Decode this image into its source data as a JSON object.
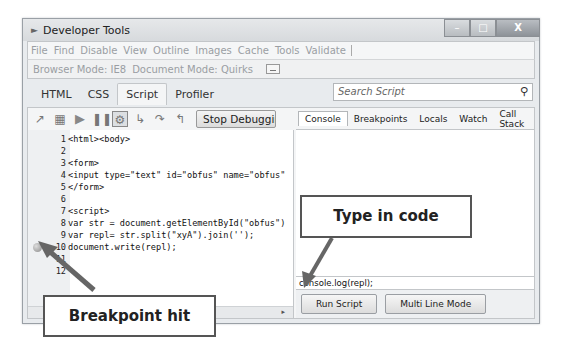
{
  "window": {
    "title": "Developer Tools",
    "controls": {
      "minimize": "–",
      "maximize": "□",
      "close": "X"
    }
  },
  "menubar": {
    "items": [
      "File",
      "Find",
      "Disable",
      "View",
      "Outline",
      "Images",
      "Cache",
      "Tools",
      "Validate"
    ]
  },
  "modebar": {
    "browser_mode": "Browser Mode: IE8",
    "document_mode": "Document Mode: Quirks"
  },
  "tabs": {
    "items": [
      "HTML",
      "CSS",
      "Script",
      "Profiler"
    ],
    "active": "Script"
  },
  "search": {
    "placeholder": "Search Script",
    "icon": "search-icon"
  },
  "toolbar": {
    "icons": [
      "select-element-icon",
      "clear-browser-icon",
      "continue-icon",
      "break-all-icon",
      "break-on-error-icon",
      "step-into-icon",
      "step-over-icon",
      "step-out-icon"
    ],
    "stop_debugging_label": "Stop Debugging"
  },
  "code": {
    "lines": [
      {
        "n": "1",
        "text": "<html><body>"
      },
      {
        "n": "2",
        "text": ""
      },
      {
        "n": "3",
        "text": "<form>"
      },
      {
        "n": "4",
        "text": "<input type=\"text\" id=\"obfus\" name=\"obfus\""
      },
      {
        "n": "5",
        "text": "</form>"
      },
      {
        "n": "6",
        "text": ""
      },
      {
        "n": "7",
        "text": "<script>"
      },
      {
        "n": "8",
        "text": "var str = document.getElementById(\"obfus\")"
      },
      {
        "n": "9",
        "text": "var repl= str.split(\"xyA\").join('');"
      },
      {
        "n": "10",
        "text": "document.write(repl);"
      },
      {
        "n": "11",
        "text": ""
      },
      {
        "n": "12",
        "text": ""
      }
    ],
    "breakpoint_line": "10"
  },
  "console": {
    "tabs": [
      "Console",
      "Breakpoints",
      "Locals",
      "Watch",
      "Call Stack"
    ],
    "active_tab": "Console",
    "input_value": "console.log(repl);",
    "run_script_label": "Run Script",
    "multi_line_label": "Multi Line Mode"
  },
  "annotations": {
    "type_in_code": "Type in code",
    "breakpoint_hit": "Breakpoint hit",
    "arrow_color": "#666666"
  }
}
